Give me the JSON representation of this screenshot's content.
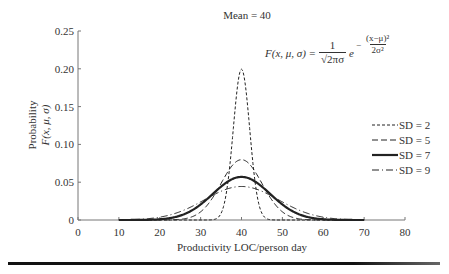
{
  "chart_data": {
    "type": "line",
    "title": "Mean = 40",
    "xlabel": "Productivity LOC/person day",
    "ylabel": "Probability",
    "ylabel2": "F(x, μ, σ)",
    "xlim": [
      0,
      80
    ],
    "ylim": [
      0,
      0.25
    ],
    "xticks": [
      0,
      10,
      20,
      30,
      40,
      50,
      60,
      70,
      80
    ],
    "xtick_labels": [
      "0",
      "10",
      "20",
      "30",
      "40",
      "50",
      "60",
      "70",
      "80"
    ],
    "yticks": [
      0,
      0.05,
      0.1,
      0.15,
      0.2,
      0.25
    ],
    "ytick_labels": [
      "0",
      "0.05",
      "0.10",
      "0.15",
      "0.20",
      "0.25"
    ],
    "grid": false,
    "legend_position": "right",
    "mean": 40,
    "x_range": [
      10,
      70
    ],
    "series": [
      {
        "name": "SD = 2",
        "sd": 2,
        "style": "short-dash",
        "peak": 0.199
      },
      {
        "name": "SD = 5",
        "sd": 5,
        "style": "dash",
        "peak": 0.08
      },
      {
        "name": "SD = 7",
        "sd": 7,
        "style": "solid",
        "peak": 0.057
      },
      {
        "name": "SD = 9",
        "sd": 9,
        "style": "dash-dot",
        "peak": 0.044
      }
    ],
    "annotation": {
      "lhs": "F(x, μ, σ) =",
      "num": "1",
      "den": "√2πσ",
      "e": "e",
      "exp_sign": "−",
      "exp_num": "(x−μ)²",
      "exp_den": "2σ²"
    }
  }
}
